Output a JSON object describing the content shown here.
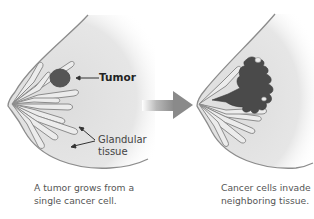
{
  "diagram": {
    "panels": [
      {
        "id": "before",
        "labels": {
          "tumor": "Tumor",
          "glandular_line1": "Glandular",
          "glandular_line2": "tissue"
        },
        "caption_line1": "A tumor grows from a",
        "caption_line2": "single cancer cell."
      },
      {
        "id": "after",
        "caption_line1": "Cancer cells invade",
        "caption_line2": "neighboring tissue."
      }
    ],
    "arrow": {
      "direction": "right",
      "color": "#8a8a8a"
    },
    "colors": {
      "tissue_fill": "#e2e2e2",
      "outline": "#8c8c8c",
      "lobule_fill": "#ececec",
      "tumor": "#555555",
      "spread": "#4a4a4a"
    }
  }
}
